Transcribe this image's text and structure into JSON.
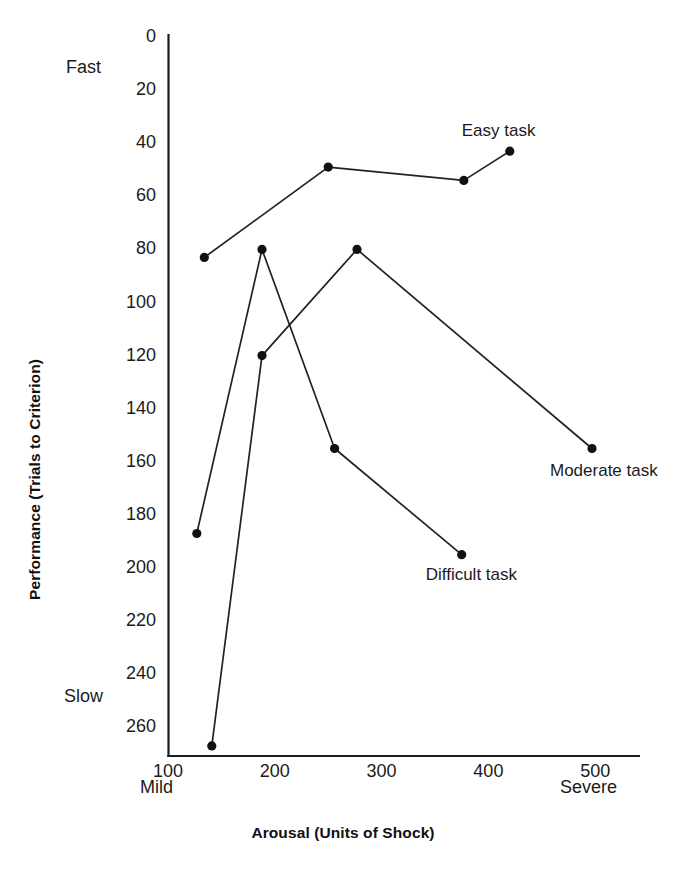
{
  "chart_data": {
    "type": "line",
    "title": "",
    "xlabel": "Arousal (Units of Shock)",
    "ylabel": "Performance (Trials to Criterion)",
    "xlim": [
      100,
      540
    ],
    "ylim": [
      0,
      275
    ],
    "y_axis_inverted": true,
    "grid": false,
    "legend": "inline-annotations",
    "xticks": [
      100,
      200,
      300,
      400,
      500
    ],
    "xtick_labels": [
      "100",
      "200",
      "300",
      "400",
      "500"
    ],
    "yticks": [
      0,
      20,
      40,
      60,
      80,
      100,
      120,
      140,
      160,
      180,
      200,
      220,
      240,
      260
    ],
    "ytick_labels": [
      "0",
      "20",
      "40",
      "60",
      "80",
      "100",
      "120",
      "140",
      "160",
      "180",
      "200",
      "220",
      "240",
      "260"
    ],
    "x_axis_endcaps": {
      "left": "Mild",
      "right": "Severe"
    },
    "y_axis_endcaps": {
      "top": "Fast",
      "bottom": "Slow"
    },
    "series": [
      {
        "name": "Easy task",
        "label": "Easy task",
        "x": [
          134,
          250,
          377,
          420
        ],
        "y": [
          83,
          49,
          54,
          43
        ]
      },
      {
        "name": "Moderate task",
        "label": "Moderate task",
        "x": [
          141,
          188,
          277,
          497
        ],
        "y": [
          267,
          120,
          80,
          155
        ]
      },
      {
        "name": "Difficult task",
        "label": "Difficult task",
        "x": [
          127,
          188,
          256,
          375
        ],
        "y": [
          187,
          80,
          155,
          195
        ]
      }
    ]
  },
  "axis": {
    "y_title": "Performance (Trials to Criterion)",
    "x_title": "Arousal (Units of Shock)",
    "fast_label": "Fast",
    "slow_label": "Slow",
    "mild_label": "Mild",
    "severe_label": "Severe"
  },
  "annotations": {
    "easy": "Easy task",
    "moderate": "Moderate task",
    "difficult": "Difficult task"
  },
  "colors": {
    "line": "#222222",
    "marker": "#111111",
    "axis": "#1b1b1b",
    "background": "#ffffff"
  }
}
